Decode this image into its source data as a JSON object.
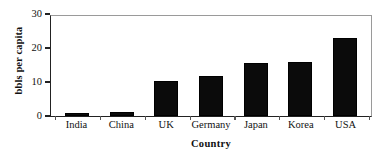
{
  "chart_data": {
    "type": "bar",
    "title": "",
    "xlabel": "Country",
    "ylabel": "bbls per capita",
    "categories": [
      "India",
      "China",
      "UK",
      "Germany",
      "Japan",
      "Korea",
      "USA"
    ],
    "values": [
      0.8,
      1.1,
      10.3,
      11.8,
      15.5,
      16.0,
      23.0
    ],
    "ylim": [
      0,
      30
    ],
    "yticks": [
      0,
      10,
      20,
      30
    ],
    "ytick_labels": [
      "0",
      "10",
      "20",
      "30"
    ],
    "grid": false,
    "legend": null,
    "bar_color": "#0b0b0b",
    "axis_color": "#222222",
    "frame_color": "#9a9a9a",
    "background": "#ffffff"
  }
}
